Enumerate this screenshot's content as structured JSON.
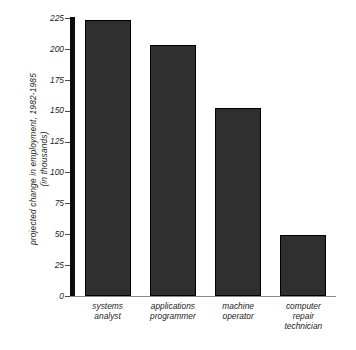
{
  "chart_data": {
    "type": "bar",
    "title": "",
    "subtitle": "",
    "xlabel": "",
    "ylabel": "projected change in employment, 1982-1985 (in thousands)",
    "ylabel_line1": "projected  change  in  employment,  1982-1985",
    "ylabel_line2": "(in  thousands)",
    "categories": [
      "systems analyst",
      "applications programmer",
      "machine operator",
      "computer repair technician"
    ],
    "category_lines": [
      [
        "systems",
        "analyst"
      ],
      [
        "applications",
        "programmer"
      ],
      [
        "machine",
        "operator"
      ],
      [
        "computer",
        "repair",
        "technician"
      ]
    ],
    "values": [
      223,
      203,
      152,
      49
    ],
    "ylim": [
      0,
      225
    ],
    "yticks": [
      0,
      25,
      50,
      75,
      100,
      125,
      150,
      175,
      200,
      225
    ],
    "ytick_labels": [
      "0",
      "25",
      "50",
      "75",
      "100",
      "125",
      "150",
      "175",
      "200",
      "225"
    ],
    "grid": false,
    "legend": false,
    "legend_position": "none",
    "bar_fill_color": "#2f2f2f",
    "bar_edge_color": "#000000",
    "axis_color": "#0d0d0d",
    "baseline_color": "#8a8a8a",
    "background_color": "#ffffff",
    "text_color": "#1c1c1c"
  }
}
